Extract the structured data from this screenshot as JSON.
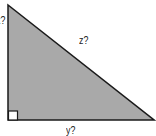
{
  "diagram": {
    "shape": "right-triangle",
    "fill_color": "#a9a9a9",
    "stroke_color": "#1a1a1a",
    "labels": {
      "left_leg": "x?",
      "hypotenuse": "z?",
      "bottom_leg": "y?"
    },
    "right_angle_marker": true
  }
}
